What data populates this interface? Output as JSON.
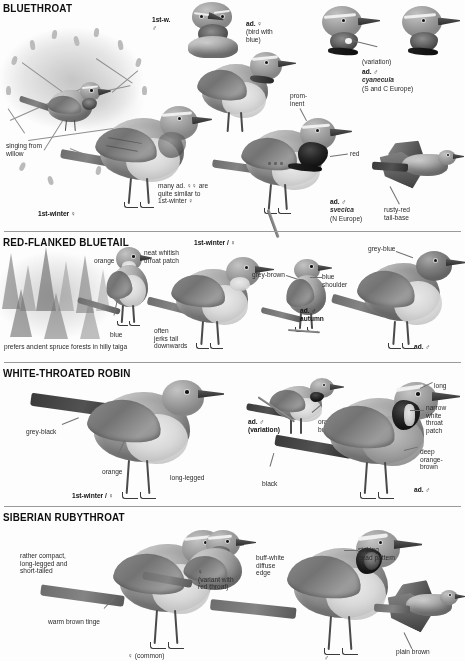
{
  "page": {
    "type": "field-guide-plate",
    "palette": {
      "ink": "#111111",
      "label": "#2b2b2b",
      "rule": "#9a9a9a",
      "background": "#fdfdfd"
    }
  },
  "sections": [
    {
      "id": "bluethroat",
      "title": "BLUETHROAT",
      "labels": [
        {
          "id": "singing-from-willow",
          "text": "singing from\nwillow",
          "style": "plain"
        },
        {
          "id": "first-winter-female",
          "text": "1st-winter ♀",
          "style": "bold"
        },
        {
          "id": "many-ad-females",
          "text": "many ad. ♀♀ are\nquite similar to\n1st-winter ♀",
          "style": "plain"
        },
        {
          "id": "first-w-male",
          "text": "1st-w.\n♂",
          "style": "bold"
        },
        {
          "id": "ad-female-bird-with-blue",
          "text": "ad. ♀",
          "sub": "(bird with\nblue)",
          "style": "bold"
        },
        {
          "id": "prominent",
          "text": "prom-\ninent",
          "style": "plain"
        },
        {
          "id": "red",
          "text": "red",
          "style": "plain"
        },
        {
          "id": "variation",
          "text": "(variation)",
          "style": "plain"
        },
        {
          "id": "ad-male-cyanecula",
          "text": "ad. ♂",
          "sci": "cyanecula",
          "range": "(S and C Europe)",
          "style": "bold"
        },
        {
          "id": "ad-male-svecica",
          "text": "ad. ♂",
          "sci": "svecica",
          "range": "(N Europe)",
          "style": "bold"
        },
        {
          "id": "rusty-red-tail-base",
          "text": "rusty-red\ntail-base",
          "style": "plain"
        }
      ]
    },
    {
      "id": "red-flanked-bluetail",
      "title": "RED-FLANKED BLUETAIL",
      "labels": [
        {
          "id": "orange",
          "text": "orange",
          "style": "plain"
        },
        {
          "id": "neat-whitish-throat-patch",
          "text": "neat whitish\nthroat patch",
          "style": "plain"
        },
        {
          "id": "blue",
          "text": "blue",
          "style": "plain"
        },
        {
          "id": "prefers-taiga",
          "text": "prefers ancient spruce forests in hilly taiga",
          "style": "plain"
        },
        {
          "id": "first-winter-female",
          "text": "1st-winter / ♀",
          "style": "bold"
        },
        {
          "id": "grey-brown",
          "text": "grey-brown",
          "style": "plain"
        },
        {
          "id": "blue-shoulder",
          "text": "blue\nshoulder",
          "style": "plain"
        },
        {
          "id": "often-jerks-tail",
          "text": "often\njerks tail\ndownwards",
          "style": "plain"
        },
        {
          "id": "ad-male-autumn",
          "text": "ad. ♂\nautumn",
          "style": "bold"
        },
        {
          "id": "grey-blue",
          "text": "grey-blue",
          "style": "plain"
        },
        {
          "id": "ad-male",
          "text": "ad. ♂",
          "style": "bold"
        }
      ]
    },
    {
      "id": "white-throated-robin",
      "title": "WHITE-THROATED ROBIN",
      "labels": [
        {
          "id": "grey-black",
          "text": "grey-black",
          "style": "plain"
        },
        {
          "id": "orange",
          "text": "orange",
          "style": "plain"
        },
        {
          "id": "long-legged",
          "text": "long-legged",
          "style": "plain"
        },
        {
          "id": "first-winter-female",
          "text": "1st-winter / ♀",
          "style": "bold"
        },
        {
          "id": "ad-male-variation",
          "text": "ad. ♂\n(variation)",
          "style": "bold"
        },
        {
          "id": "orange-buff",
          "text": "orange-\nbuff",
          "style": "plain"
        },
        {
          "id": "black",
          "text": "black",
          "style": "plain"
        },
        {
          "id": "long",
          "text": "long",
          "style": "plain"
        },
        {
          "id": "narrow-white-throat-patch",
          "text": "narrow\nwhite\nthroat\npatch",
          "style": "plain"
        },
        {
          "id": "deep-orange-brown",
          "text": "deep\norange-\nbrown",
          "style": "plain"
        },
        {
          "id": "ad-male",
          "text": "ad. ♂",
          "style": "bold"
        }
      ]
    },
    {
      "id": "siberian-rubythroat",
      "title": "SIBERIAN RUBYTHROAT",
      "labels": [
        {
          "id": "rather-compact",
          "text": "rather compact,\nlong-legged and\nshort-tailed",
          "style": "plain"
        },
        {
          "id": "warm-brown-tinge",
          "text": "warm brown tinge",
          "style": "plain"
        },
        {
          "id": "female-common",
          "text": "♀ (common)",
          "style": "plain"
        },
        {
          "id": "female-variant-red-throat",
          "text": "♀\n(variant with\nred throat)",
          "style": "plain"
        },
        {
          "id": "buff-white-diffuse-edge",
          "text": "buff-white\ndiffuse\nedge",
          "style": "plain"
        },
        {
          "id": "striking-head-pattern",
          "text": "striking\nhead pattern",
          "style": "plain"
        },
        {
          "id": "male",
          "text": "♂",
          "style": "plain"
        },
        {
          "id": "plain-brown",
          "text": "plain brown",
          "style": "plain"
        }
      ]
    }
  ]
}
